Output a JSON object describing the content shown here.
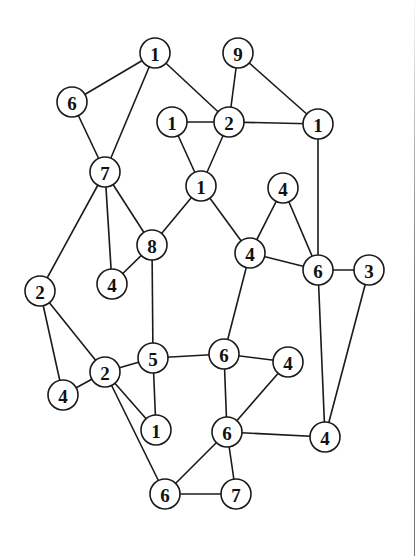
{
  "diagram": {
    "type": "undirected-graph",
    "node_radius": 15,
    "colors": {
      "stroke": "#1a1a1a",
      "fill": "#ffffff",
      "text": "#111111",
      "background": "#ffffff"
    },
    "nodes": [
      {
        "id": "A",
        "label": "1",
        "x": 155,
        "y": 53
      },
      {
        "id": "B",
        "label": "9",
        "x": 238,
        "y": 53
      },
      {
        "id": "C",
        "label": "6",
        "x": 72,
        "y": 102
      },
      {
        "id": "D",
        "label": "1",
        "x": 172,
        "y": 122
      },
      {
        "id": "E",
        "label": "2",
        "x": 229,
        "y": 122
      },
      {
        "id": "F",
        "label": "1",
        "x": 318,
        "y": 124
      },
      {
        "id": "G",
        "label": "7",
        "x": 105,
        "y": 172
      },
      {
        "id": "H",
        "label": "1",
        "x": 201,
        "y": 186
      },
      {
        "id": "I",
        "label": "4",
        "x": 283,
        "y": 188
      },
      {
        "id": "J",
        "label": "8",
        "x": 152,
        "y": 245
      },
      {
        "id": "K",
        "label": "4",
        "x": 250,
        "y": 253
      },
      {
        "id": "L",
        "label": "6",
        "x": 318,
        "y": 270
      },
      {
        "id": "M",
        "label": "3",
        "x": 369,
        "y": 270
      },
      {
        "id": "N",
        "label": "4",
        "x": 112,
        "y": 284
      },
      {
        "id": "O",
        "label": "2",
        "x": 40,
        "y": 291
      },
      {
        "id": "P",
        "label": "5",
        "x": 153,
        "y": 358
      },
      {
        "id": "Q",
        "label": "6",
        "x": 224,
        "y": 354
      },
      {
        "id": "R",
        "label": "4",
        "x": 288,
        "y": 362
      },
      {
        "id": "S",
        "label": "2",
        "x": 105,
        "y": 372
      },
      {
        "id": "T",
        "label": "4",
        "x": 63,
        "y": 395
      },
      {
        "id": "U",
        "label": "1",
        "x": 156,
        "y": 430
      },
      {
        "id": "V",
        "label": "6",
        "x": 227,
        "y": 432
      },
      {
        "id": "W",
        "label": "4",
        "x": 325,
        "y": 437
      },
      {
        "id": "X",
        "label": "6",
        "x": 165,
        "y": 494
      },
      {
        "id": "Y",
        "label": "7",
        "x": 236,
        "y": 494
      }
    ],
    "edges": [
      [
        "A",
        "C"
      ],
      [
        "A",
        "G"
      ],
      [
        "A",
        "E"
      ],
      [
        "B",
        "E"
      ],
      [
        "B",
        "F"
      ],
      [
        "D",
        "E"
      ],
      [
        "E",
        "F"
      ],
      [
        "D",
        "H"
      ],
      [
        "E",
        "H"
      ],
      [
        "C",
        "G"
      ],
      [
        "G",
        "J"
      ],
      [
        "G",
        "N"
      ],
      [
        "G",
        "O"
      ],
      [
        "H",
        "J"
      ],
      [
        "H",
        "K"
      ],
      [
        "I",
        "K"
      ],
      [
        "I",
        "L"
      ],
      [
        "K",
        "L"
      ],
      [
        "F",
        "L"
      ],
      [
        "L",
        "M"
      ],
      [
        "J",
        "N"
      ],
      [
        "J",
        "P"
      ],
      [
        "K",
        "Q"
      ],
      [
        "O",
        "S"
      ],
      [
        "O",
        "T"
      ],
      [
        "S",
        "T"
      ],
      [
        "S",
        "P"
      ],
      [
        "S",
        "U"
      ],
      [
        "S",
        "X"
      ],
      [
        "P",
        "U"
      ],
      [
        "P",
        "Q"
      ],
      [
        "Q",
        "R"
      ],
      [
        "Q",
        "V"
      ],
      [
        "R",
        "V"
      ],
      [
        "V",
        "W"
      ],
      [
        "L",
        "W"
      ],
      [
        "M",
        "W"
      ],
      [
        "V",
        "X"
      ],
      [
        "V",
        "Y"
      ],
      [
        "X",
        "Y"
      ]
    ]
  }
}
